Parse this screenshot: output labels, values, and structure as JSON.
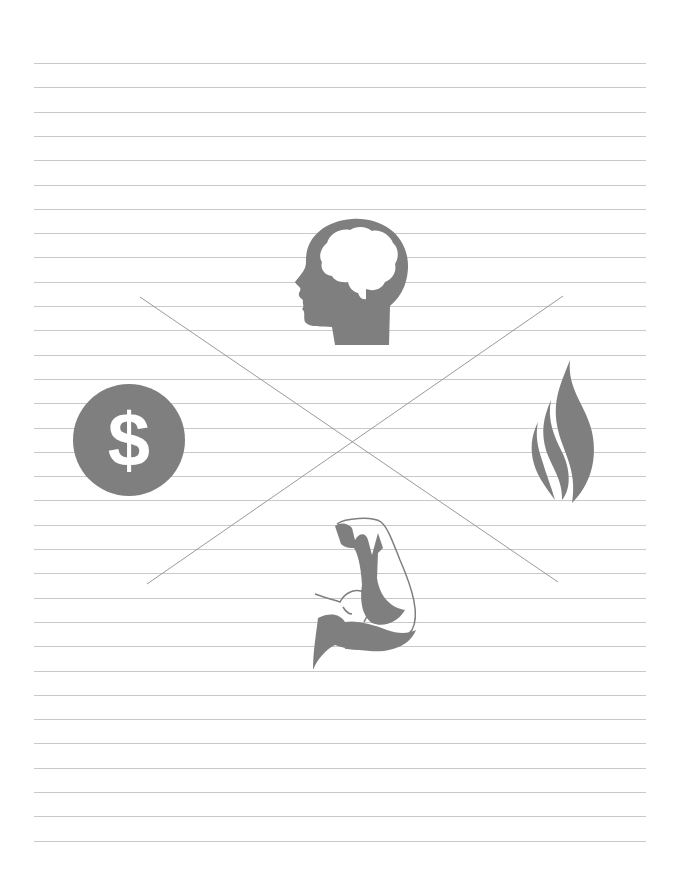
{
  "page": {
    "width": 679,
    "height": 891,
    "background": "#ffffff"
  },
  "ruling": {
    "count": 33,
    "first_y": 63,
    "spacing": 24.3,
    "left": 34,
    "right": 646,
    "color": "#c9c9c9"
  },
  "cross": {
    "color": "#9a9a9a",
    "lines": [
      {
        "x1": 140,
        "y1": 297,
        "x2": 558,
        "y2": 582
      },
      {
        "x1": 147,
        "y1": 584,
        "x2": 563,
        "y2": 296
      }
    ]
  },
  "icons": {
    "color": "#7f7f7f",
    "top": {
      "name": "head-brain-icon",
      "label": "Mind"
    },
    "left": {
      "name": "dollar-coin-icon",
      "label": "Money",
      "glyph": "$"
    },
    "right": {
      "name": "flame-icon",
      "label": "Spirit"
    },
    "bottom": {
      "name": "flexed-arm-icon",
      "label": "Body"
    }
  }
}
